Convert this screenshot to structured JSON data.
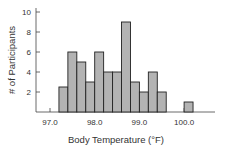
{
  "chart_data": {
    "type": "bar",
    "title": "",
    "xlabel": "Body Temperature (°F)",
    "ylabel": "# of Participants",
    "bin_width": 0.2,
    "bins": [
      {
        "start": 97.2,
        "end": 97.4,
        "count": 2.5
      },
      {
        "start": 97.4,
        "end": 97.6,
        "count": 6
      },
      {
        "start": 97.6,
        "end": 97.8,
        "count": 5
      },
      {
        "start": 97.8,
        "end": 98.0,
        "count": 3
      },
      {
        "start": 98.0,
        "end": 98.2,
        "count": 6
      },
      {
        "start": 98.2,
        "end": 98.4,
        "count": 4
      },
      {
        "start": 98.4,
        "end": 98.6,
        "count": 4
      },
      {
        "start": 98.6,
        "end": 98.8,
        "count": 9
      },
      {
        "start": 98.8,
        "end": 99.0,
        "count": 3
      },
      {
        "start": 99.0,
        "end": 99.2,
        "count": 2
      },
      {
        "start": 99.2,
        "end": 99.4,
        "count": 4
      },
      {
        "start": 99.4,
        "end": 99.6,
        "count": 2
      },
      {
        "start": 100.0,
        "end": 100.2,
        "count": 1
      }
    ],
    "categories": [
      "97.2",
      "97.4",
      "97.6",
      "97.8",
      "98.0",
      "98.2",
      "98.4",
      "98.6",
      "98.8",
      "99.0",
      "99.2",
      "99.4",
      "100.0"
    ],
    "values": [
      2.5,
      6,
      5,
      3,
      6,
      4,
      4,
      9,
      3,
      2,
      4,
      2,
      1
    ],
    "x_ticks": [
      "97.0",
      "98.0",
      "99.0",
      "100.0"
    ],
    "y_ticks": [
      "2",
      "4",
      "6",
      "8",
      "10"
    ],
    "xlim": [
      96.8,
      100.7
    ],
    "ylim": [
      0,
      10.5
    ],
    "grid": false,
    "legend": null,
    "bar_color": "#b3b3b3",
    "edge_color": "#222222"
  }
}
